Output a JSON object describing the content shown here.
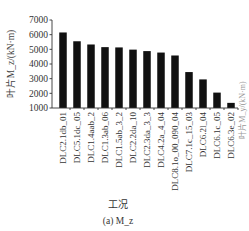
{
  "chart_data": {
    "type": "bar",
    "title": "",
    "xlabel": "工况",
    "ylabel": "叶片M_z/(kN·m)",
    "caption": "(a) M_z",
    "ylim": [
      1000,
      7000
    ],
    "yticks": [
      1000,
      2000,
      3000,
      4000,
      5000,
      6000,
      7000
    ],
    "grid": false,
    "legend": null,
    "bar_color": "#111111",
    "categories": [
      "DLC2.1db_01",
      "DLC5.1dc_05",
      "DLC1.4aab_2",
      "DLC1.3ab_06",
      "DLC1.5ab_3_2",
      "DLC2.2da_10",
      "DLC2.3da_3_3",
      "DLC4.2a_4_04",
      "DLC8.1o_00_090_04",
      "DLC7.1c_15_03",
      "DLC6.2l_04",
      "DLC6.1c_05",
      "DLC6.3e_02"
    ],
    "values": [
      6150,
      5550,
      5330,
      5150,
      5130,
      4980,
      4880,
      4780,
      4580,
      3450,
      2950,
      2050,
      1350
    ]
  },
  "side_text": "叶片M_y/(kN·m)"
}
